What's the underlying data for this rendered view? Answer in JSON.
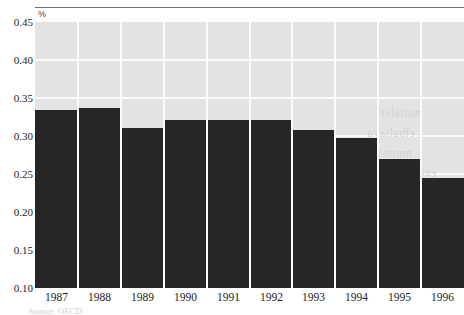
{
  "chart_data": {
    "type": "bar",
    "title": "",
    "subtitle": "",
    "xlabel": "",
    "ylabel": "%",
    "unit_label": "%",
    "categories": [
      "1987",
      "1988",
      "1989",
      "1990",
      "1991",
      "1992",
      "1993",
      "1994",
      "1995",
      "1996"
    ],
    "values": [
      0.334,
      0.337,
      0.31,
      0.321,
      0.321,
      0.321,
      0.308,
      0.297,
      0.27,
      0.245
    ],
    "series": [
      {
        "name": "",
        "values": [
          0.334,
          0.337,
          0.31,
          0.321,
          0.321,
          0.321,
          0.308,
          0.297,
          0.27,
          0.245
        ]
      }
    ],
    "ylim": [
      0.1,
      0.45
    ],
    "yticks": [
      "0.45",
      "0.40",
      "0.35",
      "0.30",
      "0.25",
      "0.20",
      "0.15",
      "0.10"
    ],
    "ytick_values": [
      0.45,
      0.4,
      0.35,
      0.3,
      0.25,
      0.2,
      0.15,
      0.1
    ],
    "grid": "horizontal-and-vertical",
    "legend": "none",
    "colors": {
      "bar": "#262626",
      "plot_background": "#e3e3e3",
      "gridline": "#fbfbfb",
      "axis_text": "#1c1c1c",
      "top_rule": "#6f6f6f",
      "ghost_text": "#d2d2d2"
    }
  },
  "axes": {
    "y_unit": "%",
    "y_ticks": [
      {
        "label": "0.45",
        "value": 0.45
      },
      {
        "label": "0.40",
        "value": 0.4
      },
      {
        "label": "0.35",
        "value": 0.35
      },
      {
        "label": "0.30",
        "value": 0.3
      },
      {
        "label": "0.25",
        "value": 0.25
      },
      {
        "label": "0.20",
        "value": 0.2
      },
      {
        "label": "0.15",
        "value": 0.15
      },
      {
        "label": "0.10",
        "value": 0.1
      }
    ],
    "x_ticks": [
      {
        "label": "1987"
      },
      {
        "label": "1988"
      },
      {
        "label": "1989"
      },
      {
        "label": "1990"
      },
      {
        "label": "1991"
      },
      {
        "label": "1992"
      },
      {
        "label": "1993"
      },
      {
        "label": "1994"
      },
      {
        "label": "1995"
      },
      {
        "label": "1996"
      }
    ]
  },
  "artifacts": {
    "ghost_text_lines": [
      "noitaler",
      "elbaliava",
      "mumitpo",
      "evobacne"
    ],
    "footer_clipped_text": "Source: OECD"
  }
}
